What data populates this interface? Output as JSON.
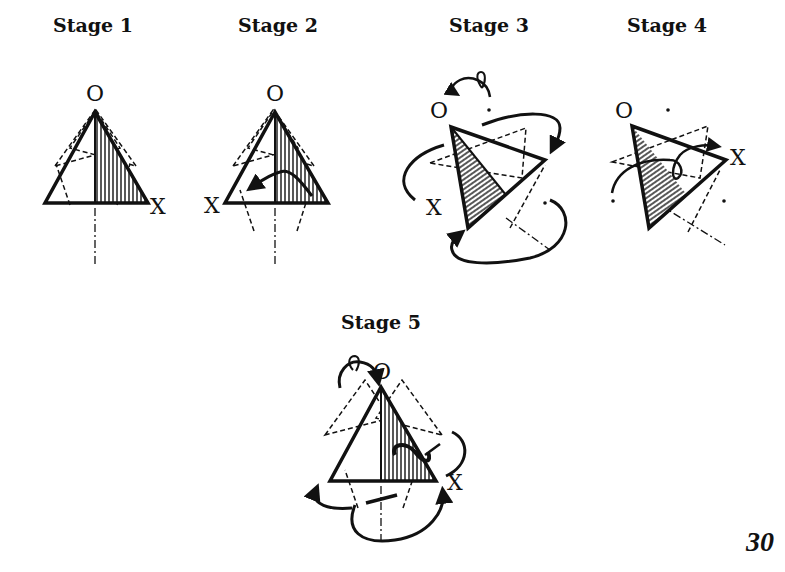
{
  "stages": [
    {
      "title": "Stage 1",
      "vertex_label": "O",
      "point_label": "X"
    },
    {
      "title": "Stage 2",
      "vertex_label": "O",
      "point_label": "X"
    },
    {
      "title": "Stage 3",
      "vertex_label": "O",
      "point_label": "X"
    },
    {
      "title": "Stage 4",
      "vertex_label": "O",
      "point_label": "X"
    },
    {
      "title": "Stage 5",
      "vertex_label": "O",
      "point_label": "X"
    }
  ],
  "page_number": "30",
  "colors": {
    "ink": "#111111",
    "background": "#ffffff"
  }
}
